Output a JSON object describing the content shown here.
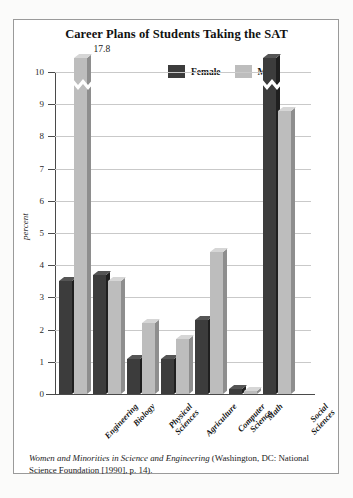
{
  "chart_data": {
    "type": "bar",
    "title": "Career Plans of Students Taking the SAT",
    "xlabel": "",
    "ylabel": "percent",
    "ylim": [
      0,
      10
    ],
    "grid": true,
    "legend_position": "top",
    "categories": [
      "Engineering",
      "Biology",
      "Physical\nSciences",
      "Agriculture",
      "Computer\nScience",
      "Math",
      "Social\nSciences"
    ],
    "yticks": [
      "0",
      "1",
      "2",
      "3",
      "4",
      "5",
      "6",
      "7",
      "8",
      "9",
      "10"
    ],
    "series": [
      {
        "name": "Female",
        "color": "#3c3c3c",
        "values": [
          3.5,
          3.7,
          1.1,
          1.1,
          2.3,
          0.15,
          14.4
        ]
      },
      {
        "name": "Male",
        "color": "#bdbdbd",
        "values": [
          17.8,
          3.5,
          2.2,
          1.7,
          4.4,
          0.1,
          8.8
        ]
      }
    ],
    "annotations": [
      {
        "text": "17.8",
        "series": "Male",
        "category": "Engineering",
        "note": "axis break, bar truncated"
      },
      {
        "text": "14.4",
        "series": "Female",
        "category": "Social Sciences",
        "note": "axis break, bar truncated"
      }
    ]
  },
  "legend": {
    "items": [
      {
        "label": "Female",
        "swatch": "#3c3c3c"
      },
      {
        "label": "Male",
        "swatch": "#bdbdbd"
      }
    ]
  },
  "caption": {
    "source_title": "Women and Minorities in Science and Engineering",
    "rest": " (Washington, DC: National Science Foundation [1990], p. 14)."
  }
}
